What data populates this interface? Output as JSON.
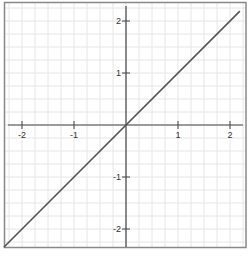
{
  "chart_data": {
    "type": "line",
    "title": "",
    "xlabel": "",
    "ylabel": "",
    "xlim": [
      -2.3,
      2.3
    ],
    "ylim": [
      -2.35,
      2.4
    ],
    "grid": true,
    "grid_step": 0.25,
    "x_ticks": [
      -2,
      -1,
      1,
      2
    ],
    "y_ticks": [
      2,
      1,
      -1,
      -2
    ],
    "x_tick_labels": [
      "-2",
      "-1",
      "1",
      "2"
    ],
    "y_tick_labels": [
      "2",
      "1",
      "-1",
      "-2"
    ],
    "series": [
      {
        "name": "y = x",
        "x": [
          -2.35,
          2.19
        ],
        "y": [
          -2.35,
          2.19
        ],
        "color": "#555555"
      }
    ]
  },
  "colors": {
    "frame": "#888888",
    "axis": "#444444",
    "grid": "#e6e6e6",
    "line": "#555555"
  }
}
